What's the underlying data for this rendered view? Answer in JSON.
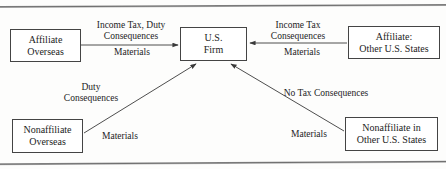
{
  "diagram": {
    "nodes": [
      {
        "id": "affiliate-overseas",
        "label": "Affiliate\nOverseas"
      },
      {
        "id": "us-firm",
        "label": "U.S.\nFirm"
      },
      {
        "id": "affiliate-other-us-states",
        "label": "Affiliate:\nOther U.S. States"
      },
      {
        "id": "nonaffiliate-overseas",
        "label": "Nonaffiliate\nOverseas"
      },
      {
        "id": "nonaffiliate-other-us-states",
        "label": "Nonaffiliate in\nOther U.S. States"
      }
    ],
    "edges": [
      {
        "id": "affiliate-overseas-to-us-firm",
        "from": "affiliate-overseas",
        "to": "us-firm",
        "label_above": "Income Tax, Duty\nConsequences",
        "label_below": "Materials"
      },
      {
        "id": "affiliate-states-to-us-firm",
        "from": "affiliate-other-us-states",
        "to": "us-firm",
        "label_above": "Income Tax\nConsequences",
        "label_below": "Materials"
      },
      {
        "id": "nonaffiliate-overseas-to-us-firm",
        "from": "nonaffiliate-overseas",
        "to": "us-firm",
        "label_above": "Duty\nConsequences",
        "label_below": "Materials"
      },
      {
        "id": "nonaffiliate-states-to-us-firm",
        "from": "nonaffiliate-other-us-states",
        "to": "us-firm",
        "label_above": "No Tax Consequences",
        "label_below": "Materials"
      }
    ],
    "colors": {
      "box_border": "#444444",
      "text": "#1c1c1c",
      "arrow": "#3a3a3a",
      "rule": "#6f6f6f",
      "background": "#fdfdfc"
    }
  }
}
